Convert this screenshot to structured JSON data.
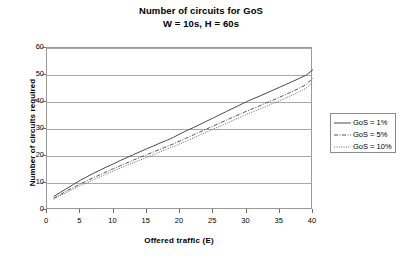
{
  "chart_data": {
    "type": "line",
    "title": "Number of circuits for GoS",
    "subtitle": "W = 10s, H = 60s",
    "xlabel": "Offered traffic (E)",
    "ylabel": "Number of circuits required",
    "xlim": [
      0,
      40
    ],
    "ylim": [
      0,
      60
    ],
    "xticks": [
      0,
      5,
      10,
      15,
      20,
      25,
      30,
      35,
      40
    ],
    "yticks": [
      0,
      10,
      20,
      30,
      40,
      50,
      60
    ],
    "grid": "horizontal",
    "legend_position": "right",
    "x": [
      1,
      2,
      3,
      4,
      5,
      6,
      7,
      8,
      9,
      10,
      11,
      12,
      13,
      14,
      15,
      16,
      17,
      18,
      19,
      20,
      21,
      22,
      23,
      24,
      25,
      26,
      27,
      28,
      29,
      30,
      31,
      32,
      33,
      34,
      35,
      36,
      37,
      38,
      39,
      40
    ],
    "series": [
      {
        "name": "GoS = 1%",
        "style": "solid",
        "color": "#4a4a4a",
        "values": [
          5,
          6.5,
          8,
          9.5,
          11,
          12.3,
          13.6,
          14.8,
          16,
          17.1,
          18.3,
          19.4,
          20.5,
          21.6,
          22.7,
          23.7,
          24.8,
          25.8,
          26.9,
          28.2,
          29.4,
          30.5,
          31.7,
          32.9,
          34.1,
          35.3,
          36.5,
          37.7,
          38.9,
          40.1,
          41.2,
          42.2,
          43.3,
          44.4,
          45.5,
          46.6,
          47.7,
          48.8,
          50,
          52
        ]
      },
      {
        "name": "GoS = 5%",
        "style": "dashdot",
        "color": "#555555",
        "values": [
          4.3,
          5.7,
          7.1,
          8.4,
          9.6,
          10.8,
          12,
          13.1,
          14.2,
          15.3,
          16.4,
          17.4,
          18.5,
          19.5,
          20.5,
          21.5,
          22.5,
          23.5,
          24.5,
          25.6,
          26.7,
          27.8,
          28.9,
          30,
          31.1,
          32.2,
          33.3,
          34.4,
          35.5,
          36.6,
          37.6,
          38.6,
          39.7,
          40.7,
          41.8,
          42.9,
          44,
          45.2,
          46.5,
          49
        ]
      },
      {
        "name": "GoS = 10%",
        "style": "dotted",
        "color": "#666666",
        "values": [
          4,
          5.3,
          6.6,
          7.8,
          9,
          10.1,
          11.2,
          12.3,
          13.4,
          14.5,
          15.5,
          16.5,
          17.5,
          18.5,
          19.5,
          20.5,
          21.5,
          22.5,
          23.5,
          24.5,
          25.6,
          26.7,
          27.8,
          28.9,
          30,
          31,
          32.1,
          33.2,
          34.3,
          35.4,
          36.4,
          37.4,
          38.4,
          39.5,
          40.5,
          41.6,
          42.7,
          43.9,
          45.2,
          47.5
        ]
      }
    ]
  },
  "legend": {
    "items": [
      {
        "label": "GoS = 1%"
      },
      {
        "label": "GoS = 5%"
      },
      {
        "label": "GoS = 10%"
      }
    ]
  }
}
